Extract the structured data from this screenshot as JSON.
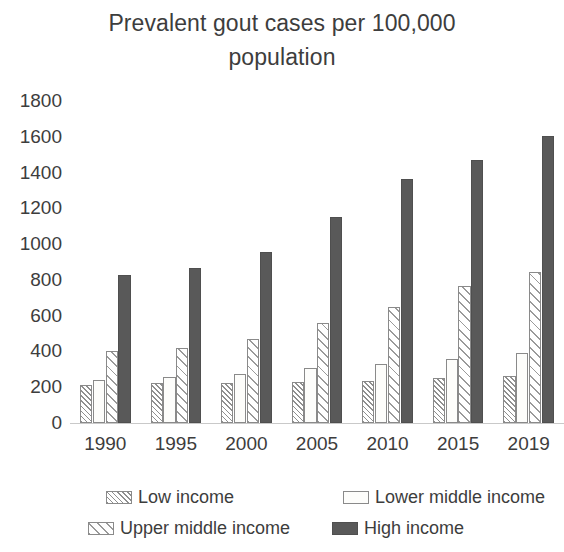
{
  "chart_data": {
    "type": "bar",
    "title": "Prevalent gout cases per 100,000\npopulation",
    "title_line_1": "Prevalent gout cases per 100,000",
    "title_line_2": "population",
    "xlabel": "",
    "ylabel": "",
    "ylim": [
      0,
      1800
    ],
    "ytick_step": 200,
    "yticks": [
      1800,
      1600,
      1400,
      1200,
      1000,
      800,
      600,
      400,
      200,
      0
    ],
    "categories": [
      "1990",
      "1995",
      "2000",
      "2005",
      "2010",
      "2015",
      "2019"
    ],
    "grid": false,
    "legend_position": "bottom",
    "series": [
      {
        "name": "Low income",
        "pattern": "dense-diagonal-hatch",
        "color": "#ffffff",
        "values": [
          215,
          225,
          225,
          230,
          235,
          250,
          265
        ]
      },
      {
        "name": "Lower middle income",
        "pattern": "solid-white",
        "color": "#fdfdfb",
        "values": [
          240,
          260,
          275,
          305,
          330,
          360,
          390
        ]
      },
      {
        "name": "Upper middle income",
        "pattern": "wide-diagonal-hatch",
        "color": "#ffffff",
        "values": [
          400,
          420,
          470,
          560,
          650,
          765,
          845
        ]
      },
      {
        "name": "High income",
        "pattern": "solid-fill",
        "color": "#595959",
        "values": [
          825,
          865,
          955,
          1150,
          1365,
          1470,
          1605
        ]
      }
    ]
  },
  "legend": {
    "items": [
      {
        "label": "Low income",
        "swatch": "swatch-dense-hatch"
      },
      {
        "label": "Lower middle income",
        "swatch": "swatch-white"
      },
      {
        "label": "Upper middle income",
        "swatch": "swatch-wide-hatch"
      },
      {
        "label": "High income",
        "swatch": "swatch-solid-dark"
      }
    ]
  },
  "colors": {
    "high_income_fill": "#595959",
    "bar_outline": "#8a8a8a",
    "text": "#3d3d3d",
    "axis_line": "#c9c9c9",
    "background": "#ffffff"
  }
}
